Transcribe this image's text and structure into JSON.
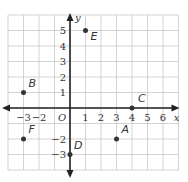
{
  "chart_data": {
    "type": "scatter",
    "title": "",
    "xlabel": "x",
    "ylabel": "y",
    "origin_label": "O",
    "xlim": [
      -4,
      7
    ],
    "ylim": [
      -4,
      6
    ],
    "grid": true,
    "x_ticks": [
      {
        "value": -3,
        "label": "−3"
      },
      {
        "value": -2,
        "label": "−2"
      },
      {
        "value": 1,
        "label": "1"
      },
      {
        "value": 2,
        "label": "2"
      },
      {
        "value": 3,
        "label": "3"
      },
      {
        "value": 4,
        "label": "4"
      },
      {
        "value": 5,
        "label": "5"
      },
      {
        "value": 6,
        "label": "6"
      }
    ],
    "y_ticks": [
      {
        "value": 5,
        "label": "5"
      },
      {
        "value": 4,
        "label": "4"
      },
      {
        "value": 3,
        "label": "3"
      },
      {
        "value": 2,
        "label": "2"
      },
      {
        "value": 1,
        "label": "1"
      },
      {
        "value": -2,
        "label": "−2"
      },
      {
        "value": -3,
        "label": "−3"
      }
    ],
    "points": [
      {
        "name": "A",
        "x": 3,
        "y": -2
      },
      {
        "name": "B",
        "x": -3,
        "y": 1
      },
      {
        "name": "C",
        "x": 4,
        "y": 0
      },
      {
        "name": "D",
        "x": 0,
        "y": -3
      },
      {
        "name": "E",
        "x": 1,
        "y": 5
      },
      {
        "name": "F",
        "x": -3,
        "y": -2
      }
    ]
  },
  "colors": {
    "grid": "#c8c8c8",
    "axis": "#222222",
    "point": "#333333",
    "text": "#333333"
  }
}
